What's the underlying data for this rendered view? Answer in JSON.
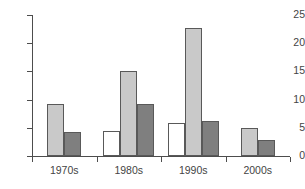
{
  "chart_data": {
    "type": "bar",
    "title": "",
    "xlabel": "",
    "ylabel": "",
    "categories": [
      "1970s",
      "1980s",
      "1990s",
      "2000s"
    ],
    "ylim": [
      0,
      25
    ],
    "yticks": [
      0,
      5,
      10,
      15,
      20,
      25
    ],
    "ytick_labels": [
      "0",
      "5",
      "10",
      "15",
      "20",
      "25"
    ],
    "grid": false,
    "legend": "none",
    "series": [
      {
        "name": "series-1",
        "color": "#ffffff",
        "fill": "white",
        "values": [
          null,
          4.5,
          5.8,
          null
        ]
      },
      {
        "name": "series-2",
        "color": "#c9c9c9",
        "fill": "light-gray",
        "values": [
          9.2,
          15.0,
          22.7,
          4.9
        ]
      },
      {
        "name": "series-3",
        "color": "#7f7f7f",
        "fill": "dark-gray",
        "values": [
          4.3,
          9.3,
          6.2,
          2.9
        ]
      }
    ],
    "axis_color": "#4d4d4d",
    "bar_outline_color": "#595959"
  }
}
